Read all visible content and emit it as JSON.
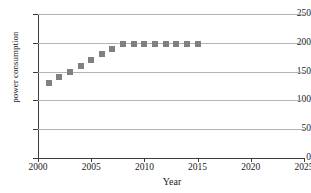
{
  "chart_data": {
    "type": "scatter",
    "title": "",
    "xlabel": "Year",
    "ylabel": "power consumption",
    "xlim": [
      2000,
      2025
    ],
    "ylim": [
      0,
      250
    ],
    "xticks": [
      2000,
      2005,
      2010,
      2015,
      2020,
      2025
    ],
    "yticks": [
      0,
      50,
      100,
      150,
      200,
      250
    ],
    "grid": "horizontal",
    "legend": "none",
    "marker_color": "#808080",
    "marker_shape": "square",
    "x": [
      2001,
      2002,
      2003,
      2004,
      2005,
      2006,
      2007,
      2008,
      2009,
      2010,
      2011,
      2012,
      2013,
      2014,
      2015
    ],
    "values": [
      130,
      140,
      150,
      160,
      170,
      180,
      190,
      198,
      198,
      198,
      198,
      198,
      198,
      198,
      198
    ],
    "series": [
      {
        "name": "power consumption",
        "values": [
          130,
          140,
          150,
          160,
          170,
          180,
          190,
          198,
          198,
          198,
          198,
          198,
          198,
          198,
          198
        ]
      }
    ]
  },
  "axes": {
    "x_title": "Year",
    "y_title": "power consumption",
    "x_tick_labels": [
      "2000",
      "2005",
      "2010",
      "2015",
      "2020",
      "2025"
    ],
    "y_tick_labels": [
      "0",
      "50",
      "100",
      "150",
      "200",
      "250"
    ]
  }
}
